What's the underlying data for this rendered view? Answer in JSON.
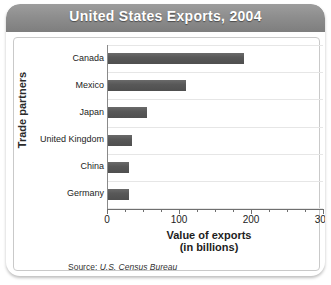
{
  "title": "United States Exports, 2004",
  "source": {
    "label": "Source:",
    "value": "U.S. Census Bureau"
  },
  "axis": {
    "y_title": "Trade partners",
    "x_title_line1": "Value of exports",
    "x_title_line2": "(in billions)"
  },
  "colors": {
    "bar": "#585858",
    "banner": "#8e8e8e",
    "gridline": "#e6e6e6",
    "axis": "#6f6f6f",
    "title_text": "#ffffff"
  },
  "chart_data": {
    "type": "bar",
    "orientation": "horizontal",
    "title": "United States Exports, 2004",
    "xlabel": "Value of exports (in billions)",
    "ylabel": "Trade partners",
    "categories": [
      "Canada",
      "Mexico",
      "Japan",
      "United Kingdom",
      "China",
      "Germany"
    ],
    "values": [
      190,
      110,
      55,
      35,
      30,
      30
    ],
    "units": "billions of US dollars",
    "xlim": [
      0,
      300
    ],
    "xticks": [
      0,
      100,
      200,
      300
    ],
    "xtick_labels": [
      "0",
      "100",
      "200",
      "300"
    ],
    "minor_tick_interval": 25,
    "grid": "horizontal",
    "legend": "none",
    "source": "Source: U.S. Census Bureau"
  }
}
